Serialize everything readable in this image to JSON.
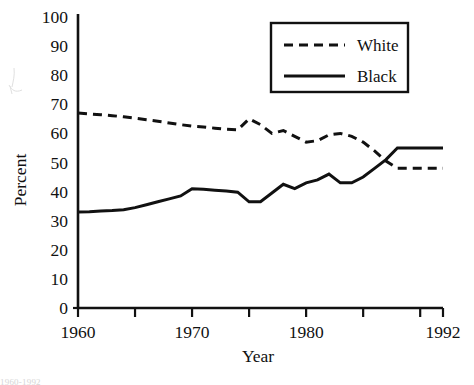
{
  "chart_data": {
    "type": "line",
    "title": "",
    "xlabel": "Year",
    "ylabel": "Percent",
    "xlim": [
      1960,
      1992
    ],
    "ylim": [
      0,
      100
    ],
    "grid": false,
    "legend_position": "top-right",
    "y_ticks": [
      0,
      10,
      20,
      30,
      40,
      50,
      60,
      70,
      80,
      90,
      100
    ],
    "y_tick_labels": [
      "0",
      "10",
      "20",
      "30",
      "40",
      "50",
      "60",
      "70",
      "80",
      "90",
      "100"
    ],
    "x_ticks": [
      1960,
      1965,
      1970,
      1975,
      1980,
      1985,
      1990
    ],
    "x_tick_labels": [
      "1960",
      "",
      "1970",
      "",
      "1980",
      "",
      ""
    ],
    "x_labeled": [
      {
        "year": 1960,
        "label": "1960"
      },
      {
        "year": 1970,
        "label": "1970"
      },
      {
        "year": 1980,
        "label": "1980"
      },
      {
        "year": 1992,
        "label": "1992"
      }
    ],
    "x": [
      1960,
      1961,
      1962,
      1963,
      1964,
      1965,
      1966,
      1967,
      1968,
      1969,
      1970,
      1971,
      1972,
      1973,
      1974,
      1975,
      1976,
      1977,
      1978,
      1979,
      1980,
      1981,
      1982,
      1983,
      1984,
      1985,
      1986,
      1987,
      1988,
      1989,
      1990,
      1991,
      1992
    ],
    "series": [
      {
        "name": "White",
        "style": "dashed",
        "color": "#111111",
        "values": [
          67,
          66.7,
          66.4,
          66.1,
          65.7,
          65.2,
          64.7,
          64.2,
          63.6,
          63.0,
          62.5,
          62.2,
          61.8,
          61.4,
          61.2,
          65.0,
          63.0,
          60.0,
          61.0,
          59.0,
          57.0,
          57.5,
          59.5,
          60.0,
          59.0,
          57.0,
          54.0,
          50.5,
          48.0,
          48.0,
          48.0,
          48.0,
          48.0
        ]
      },
      {
        "name": "Black",
        "style": "solid",
        "color": "#111111",
        "values": [
          33,
          33.1,
          33.3,
          33.5,
          33.8,
          34.5,
          35.5,
          36.5,
          37.5,
          38.5,
          41.0,
          40.8,
          40.5,
          40.2,
          39.8,
          36.5,
          36.5,
          39.5,
          42.5,
          41.0,
          43.0,
          44.0,
          46.0,
          43.0,
          43.0,
          45.0,
          48.0,
          51.0,
          55.0,
          55.0,
          55.0,
          55.0,
          55.0
        ]
      }
    ]
  },
  "legend": {
    "entries": [
      {
        "label": "White",
        "style": "dashed"
      },
      {
        "label": "Black",
        "style": "solid"
      }
    ]
  },
  "axes": {
    "y_title": "Percent",
    "x_title": "Year"
  },
  "footer": {
    "caption_fragment": "1960-1992"
  }
}
